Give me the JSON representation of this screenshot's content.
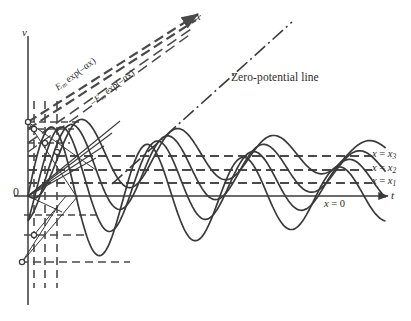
{
  "figure": {
    "title_present": false,
    "background": "#ffffff",
    "ink": "#3a3a3a"
  },
  "axes": {
    "vertical_label": "v",
    "horizontal_label": "t",
    "origin_label": "0",
    "x_axis_label": "x",
    "origin_px": {
      "x": 28,
      "y": 196
    },
    "t_axis_y": 196,
    "v_axis_x": 28
  },
  "annotations": {
    "zero_potential_line": "Zero-potential line",
    "envelope_upper": "E",
    "envelope_upper_sub": "m",
    "envelope_upper_rest": " exp(–αx)",
    "envelope_lower_sign": "–E",
    "envelope_lower_sub": "m",
    "envelope_lower_rest": " exp(–αx)"
  },
  "level_labels": [
    {
      "name": "x = x3",
      "text_lhs": "x",
      "eq": " = ",
      "text_rhs": "x",
      "sub": "3",
      "y": 156
    },
    {
      "name": "x = x2",
      "text_lhs": "x",
      "eq": " = ",
      "text_rhs": "x",
      "sub": "2",
      "y": 170
    },
    {
      "name": "x = x1",
      "text_lhs": "x",
      "eq": " = ",
      "text_rhs": "x",
      "sub": "1",
      "y": 183
    },
    {
      "name": "x = 0",
      "text_lhs": "x",
      "eq": " = ",
      "text_rhs": "0",
      "sub": "",
      "y": 206
    }
  ],
  "chart_data": {
    "type": "line",
    "xlabel": "t",
    "ylabel": "v",
    "grid": false,
    "legend": "none",
    "series": [
      {
        "name": "x = 0",
        "zero_level_y": 196,
        "amplitude_px": 74,
        "phase_deg": 0,
        "damping_alpha": 0.003,
        "wavelength_px": 96
      },
      {
        "name": "x = x1",
        "zero_level_y": 183,
        "amplitude_px": 62,
        "phase_deg": 38,
        "damping_alpha": 0.003,
        "wavelength_px": 96
      },
      {
        "name": "x = x2",
        "zero_level_y": 170,
        "amplitude_px": 52,
        "phase_deg": 76,
        "damping_alpha": 0.003,
        "wavelength_px": 96
      },
      {
        "name": "x = x3",
        "zero_level_y": 156,
        "amplitude_px": 43,
        "phase_deg": 114,
        "damping_alpha": 0.003,
        "wavelength_px": 96
      }
    ],
    "dashed_horizontal_levels": [
      156,
      170,
      183
    ],
    "dashed_vertical_lines_x": [
      34,
      45,
      57
    ],
    "marker_points": [
      {
        "x": 28,
        "y": 122
      },
      {
        "x": 34,
        "y": 129
      },
      {
        "x": 45,
        "y": 143
      },
      {
        "x": 57,
        "y": 152
      },
      {
        "x": 34,
        "y": 235
      },
      {
        "x": 22,
        "y": 262
      }
    ],
    "zero_potential_line": {
      "from": [
        118,
        178
      ],
      "to": [
        290,
        25
      ]
    },
    "envelope_upper_line": {
      "from": [
        60,
        122
      ],
      "to": [
        200,
        16
      ]
    },
    "envelope_lower_line": {
      "from": [
        60,
        143
      ],
      "to": [
        200,
        26
      ]
    }
  }
}
